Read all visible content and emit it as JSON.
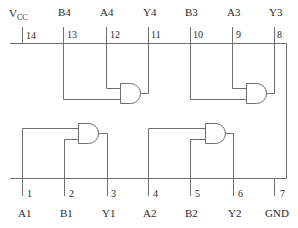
{
  "diagram": {
    "type": "ic-pinout",
    "line_color": "#6e6e6e",
    "top_pins": [
      {
        "pin": "14",
        "name": "V",
        "sub": "CC",
        "x": 22
      },
      {
        "pin": "13",
        "name": "B4",
        "x": 63
      },
      {
        "pin": "12",
        "name": "A4",
        "x": 106
      },
      {
        "pin": "11",
        "name": "Y4",
        "x": 148
      },
      {
        "pin": "10",
        "name": "B3",
        "x": 190
      },
      {
        "pin": "9",
        "name": "A3",
        "x": 232
      },
      {
        "pin": "8",
        "name": "Y3",
        "x": 274
      }
    ],
    "bottom_pins": [
      {
        "pin": "1",
        "name": "A1",
        "x": 22
      },
      {
        "pin": "2",
        "name": "B1",
        "x": 64
      },
      {
        "pin": "3",
        "name": "Y1",
        "x": 107
      },
      {
        "pin": "4",
        "name": "A2",
        "x": 148
      },
      {
        "pin": "5",
        "name": "B2",
        "x": 190
      },
      {
        "pin": "6",
        "name": "Y2",
        "x": 233
      },
      {
        "pin": "7",
        "name": "GND",
        "x": 274
      }
    ],
    "gates": [
      {
        "id": "gate-1",
        "type": "AND",
        "inputs": [
          "A1",
          "B1"
        ],
        "output": "Y1"
      },
      {
        "id": "gate-2",
        "type": "AND",
        "inputs": [
          "A2",
          "B2"
        ],
        "output": "Y2"
      },
      {
        "id": "gate-3",
        "type": "AND",
        "inputs": [
          "A3",
          "B3"
        ],
        "output": "Y3"
      },
      {
        "id": "gate-4",
        "type": "AND",
        "inputs": [
          "A4",
          "B4"
        ],
        "output": "Y4"
      }
    ]
  }
}
